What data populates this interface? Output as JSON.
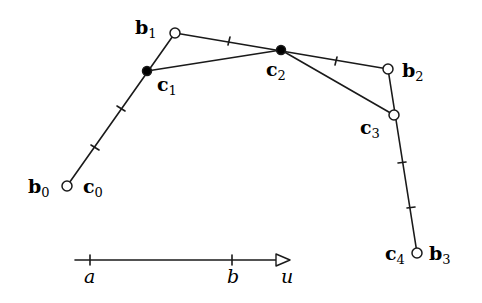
{
  "diagram": {
    "type": "bezier-control-polygon-knot-insertion",
    "stroke_color": "#1a1a1a",
    "background": "#ffffff",
    "control_points_b": [
      {
        "name": "b",
        "index": "0",
        "x": 67,
        "y": 186,
        "style": "open"
      },
      {
        "name": "b",
        "index": "1",
        "x": 175,
        "y": 33,
        "style": "open"
      },
      {
        "name": "b",
        "index": "2",
        "x": 388,
        "y": 69,
        "style": "open"
      },
      {
        "name": "b",
        "index": "3",
        "x": 417,
        "y": 253,
        "style": "open"
      }
    ],
    "points_c": [
      {
        "name": "c",
        "index": "0",
        "x": 67,
        "y": 186,
        "style": "open"
      },
      {
        "name": "c",
        "index": "1",
        "x": 147,
        "y": 71,
        "style": "filled"
      },
      {
        "name": "c",
        "index": "2",
        "x": 281,
        "y": 50,
        "style": "filled"
      },
      {
        "name": "c",
        "index": "3",
        "x": 394,
        "y": 115,
        "style": "open"
      },
      {
        "name": "c",
        "index": "4",
        "x": 417,
        "y": 253,
        "style": "open"
      }
    ],
    "labels": {
      "b0": {
        "main": "b",
        "sub": "0"
      },
      "c0": {
        "main": "c",
        "sub": "0"
      },
      "b1": {
        "main": "b",
        "sub": "1"
      },
      "c1": {
        "main": "c",
        "sub": "1"
      },
      "c2": {
        "main": "c",
        "sub": "2"
      },
      "b2": {
        "main": "b",
        "sub": "2"
      },
      "c3": {
        "main": "c",
        "sub": "3"
      },
      "c4": {
        "main": "c",
        "sub": "4"
      },
      "b3": {
        "main": "b",
        "sub": "3"
      }
    },
    "tick_marks": [
      {
        "x": 95,
        "y": 147
      },
      {
        "x": 121,
        "y": 108
      },
      {
        "x": 229,
        "y": 41
      },
      {
        "x": 336,
        "y": 61
      },
      {
        "x": 402,
        "y": 162
      },
      {
        "x": 411,
        "y": 207
      }
    ],
    "parameter_axis": {
      "x_start": 75,
      "x_end": 290,
      "y": 260,
      "ticks": [
        {
          "label": "a",
          "x": 90
        },
        {
          "label": "b",
          "x": 232
        }
      ],
      "arrow_label": "u"
    }
  }
}
